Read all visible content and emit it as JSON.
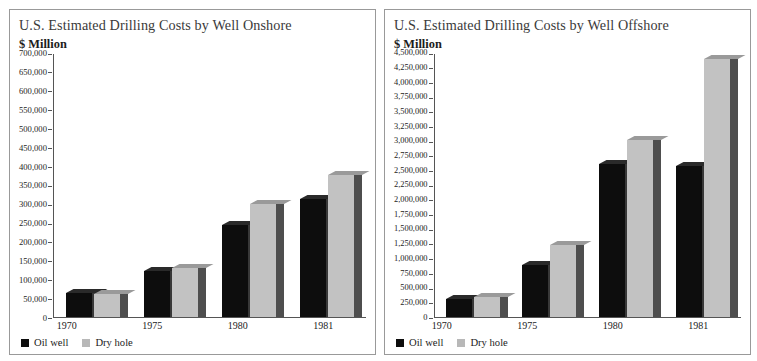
{
  "panels": [
    {
      "title": "U.S. Estimated Drilling Costs by Well Onshore",
      "unit": "$ Million",
      "legend": [
        {
          "label": "Oil well",
          "color": "#0d0d0d",
          "key": "oil"
        },
        {
          "label": "Dry hole",
          "color": "#b8b8b8",
          "key": "dry"
        }
      ],
      "chart_data": {
        "type": "bar",
        "title": "U.S. Estimated Drilling Costs by Well Onshore",
        "xlabel": "",
        "ylabel": "$ Million",
        "ylim": [
          0,
          700000
        ],
        "ytick_step": 50000,
        "grid": false,
        "legend_position": "bottom-left",
        "categories": [
          "1970",
          "1975",
          "1980",
          "1981"
        ],
        "yticks": [
          "700,000",
          "650,000",
          "600,000",
          "550,000",
          "500,000",
          "450,000",
          "400,000",
          "350,000",
          "300,000",
          "250,000",
          "200,000",
          "150,000",
          "100,000",
          "50,000",
          "0"
        ],
        "series": [
          {
            "name": "Oil well",
            "color": "#0d0d0d",
            "values": [
              64000,
              122000,
              245000,
              313000
            ]
          },
          {
            "name": "Dry hole",
            "color": "#c2c2c2",
            "values": [
              62000,
              130000,
              300000,
              377000
            ]
          }
        ]
      }
    },
    {
      "title": "U.S. Estimated Drilling Costs by Well Offshore",
      "unit": "$ Million",
      "legend": [
        {
          "label": "Oil well",
          "color": "#0d0d0d",
          "key": "oil"
        },
        {
          "label": "Dry hole",
          "color": "#b8b8b8",
          "key": "dry"
        }
      ],
      "chart_data": {
        "type": "bar",
        "title": "U.S. Estimated Drilling Costs by Well Offshore",
        "xlabel": "",
        "ylabel": "$ Million",
        "ylim": [
          0,
          4500000
        ],
        "ytick_step": 250000,
        "grid": false,
        "legend_position": "bottom-left",
        "categories": [
          "1970",
          "1975",
          "1980",
          "1981"
        ],
        "yticks": [
          "4,500,000",
          "4,250,000",
          "4,000,000",
          "3,750,000",
          "3,500,000",
          "3,250,000",
          "3,000,000",
          "2,750,000",
          "2,500,000",
          "2,250,000",
          "2,000,000",
          "1,750,000",
          "1,500,000",
          "1,250,000",
          "1,000,000",
          "750,000",
          "500,000",
          "250,000",
          "0"
        ],
        "series": [
          {
            "name": "Oil well",
            "color": "#0d0d0d",
            "values": [
              300000,
              890000,
              2620000,
              2580000
            ]
          },
          {
            "name": "Dry hole",
            "color": "#c2c2c2",
            "values": [
              345000,
              1230000,
              3020000,
              4400000
            ]
          }
        ]
      }
    }
  ]
}
